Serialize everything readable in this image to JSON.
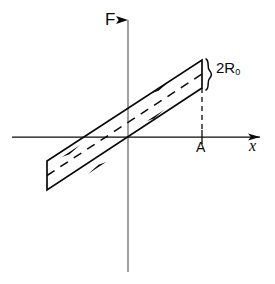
{
  "figure": {
    "kind": "hysteresis-loop-diagram",
    "background_color": "#ffffff",
    "stroke_color": "#0a0a0a",
    "width": 275,
    "height": 284,
    "labels": {
      "vertical_axis": "F",
      "horizontal_axis": "x",
      "point_on_axis": "A",
      "loop_width_prefix": "2R",
      "loop_width_subscript": "0"
    },
    "axes": {
      "vertical": {
        "x": 128,
        "y_top": 18,
        "y_bottom": 272,
        "arrow": "up"
      },
      "horizontal": {
        "y": 137,
        "x_left": 12,
        "x_right": 262,
        "arrow": "right"
      },
      "origin": {
        "x": 128,
        "y": 137
      }
    },
    "loop": {
      "shape": "parallelogram",
      "corners": [
        {
          "name": "top-right",
          "x": 202,
          "y": 60
        },
        {
          "name": "right-lower",
          "x": 202,
          "y": 88
        },
        {
          "name": "bottom-left",
          "x": 47,
          "y": 190
        },
        {
          "name": "left-upper",
          "x": 47,
          "y": 161
        }
      ],
      "center_dashed_line": {
        "x1": 47,
        "y1": 175,
        "x2": 202,
        "y2": 74
      },
      "direction": "counterclockwise",
      "arrow_markers": [
        {
          "edge": "upper",
          "x": 160,
          "y": 88,
          "direction": "up-right"
        },
        {
          "edge": "upper",
          "x": 71,
          "y": 150,
          "direction": "up-right"
        },
        {
          "edge": "lower",
          "x": 156,
          "y": 117,
          "direction": "up-right"
        },
        {
          "edge": "lower",
          "x": 97,
          "y": 168,
          "direction": "down-left"
        }
      ]
    },
    "marker_line": {
      "name": "dashed-drop-line-A",
      "x": 202,
      "y_top": 88,
      "y_bottom": 137
    },
    "brace": {
      "name": "loop-width-brace",
      "x": 208,
      "y_top": 59,
      "y_bottom": 90
    }
  }
}
